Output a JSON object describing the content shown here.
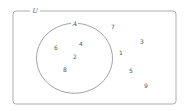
{
  "diagram": {
    "type": "venn",
    "universe": {
      "label": "U",
      "elements_outside_A": [
        "7",
        "3",
        "1",
        "5",
        "9"
      ]
    },
    "sets": [
      {
        "label": "A",
        "elements": [
          "6",
          "4",
          "2",
          "8"
        ]
      }
    ],
    "colors": {
      "stroke": "#8a8a8a",
      "text": "#555555",
      "background": "#ffffff"
    }
  },
  "labels": {
    "universe": "U",
    "set_a": "A",
    "in_a": {
      "e0": "6",
      "e1": "4",
      "e2": "2",
      "e3": "8"
    },
    "outside": {
      "e0": "7",
      "e1": "3",
      "e2": "1",
      "e3": "5",
      "e4": "9"
    }
  }
}
